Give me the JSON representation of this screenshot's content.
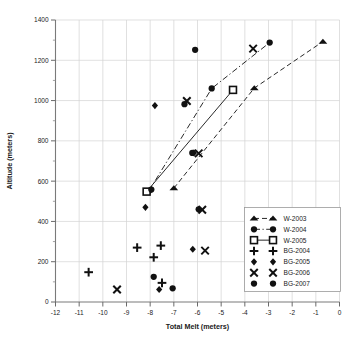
{
  "chart_data": {
    "type": "scatter",
    "title": "",
    "xlabel": "Total Melt  (meters)",
    "ylabel": "Altitude (meters)",
    "xlim": [
      -12,
      0
    ],
    "ylim": [
      0,
      1400
    ],
    "xticks": [
      -12,
      -11,
      -10,
      -9,
      -8,
      -7,
      -6,
      -5,
      -4,
      -3,
      -2,
      -1,
      0
    ],
    "xtick_labels": [
      "-12",
      "-11",
      "-10",
      "-9",
      "-8",
      "-7",
      "-6",
      "-5",
      "-4",
      "-3",
      "-2",
      "-1",
      "0"
    ],
    "yticks": [
      0,
      200,
      400,
      600,
      800,
      1000,
      1200,
      1400
    ],
    "ytick_labels": [
      "0",
      "200",
      "400",
      "600",
      "800",
      "1000",
      "1200",
      "1400"
    ],
    "y_minor_ticks": [
      100,
      300,
      500,
      700,
      900,
      1100,
      1300
    ],
    "grid": true,
    "grid_axis": "both",
    "legend_position": "lower-right",
    "series": [
      {
        "name": "W-2003",
        "marker": "triangle",
        "filled": true,
        "line": "dashed",
        "points": [
          {
            "x": -7.0,
            "y": 565
          },
          {
            "x": -3.6,
            "y": 1062
          },
          {
            "x": -0.7,
            "y": 1293
          }
        ]
      },
      {
        "name": "W-2004",
        "marker": "circle",
        "filled": true,
        "line": "dash-dot",
        "points": [
          {
            "x": -8.05,
            "y": 552
          },
          {
            "x": -5.4,
            "y": 1060
          },
          {
            "x": -2.95,
            "y": 1288
          }
        ]
      },
      {
        "name": "W-2005",
        "marker": "square-open",
        "filled": false,
        "line": "solid",
        "points": [
          {
            "x": -8.15,
            "y": 548
          },
          {
            "x": -4.5,
            "y": 1053
          }
        ]
      },
      {
        "name": "BG-2004",
        "marker": "plus",
        "filled": true,
        "line": "none",
        "points": [
          {
            "x": -10.6,
            "y": 148
          },
          {
            "x": -8.55,
            "y": 270
          },
          {
            "x": -7.85,
            "y": 222
          },
          {
            "x": -7.55,
            "y": 280
          },
          {
            "x": -7.5,
            "y": 95
          }
        ]
      },
      {
        "name": "BG-2005",
        "marker": "diamond",
        "filled": true,
        "line": "none",
        "points": [
          {
            "x": -7.8,
            "y": 975
          },
          {
            "x": -8.2,
            "y": 470
          },
          {
            "x": -6.15,
            "y": 740
          },
          {
            "x": -6.2,
            "y": 262
          },
          {
            "x": -7.62,
            "y": 62
          }
        ]
      },
      {
        "name": "BG-2006",
        "marker": "cross",
        "filled": true,
        "line": "none",
        "points": [
          {
            "x": -9.4,
            "y": 62
          },
          {
            "x": -6.45,
            "y": 998
          },
          {
            "x": -5.95,
            "y": 738
          },
          {
            "x": -5.8,
            "y": 458
          },
          {
            "x": -5.68,
            "y": 255
          },
          {
            "x": -3.65,
            "y": 1258
          }
        ]
      },
      {
        "name": "BG-2007",
        "marker": "circle",
        "filled": true,
        "line": "none",
        "points": [
          {
            "x": -6.1,
            "y": 1252
          },
          {
            "x": -6.55,
            "y": 982
          },
          {
            "x": -6.22,
            "y": 740
          },
          {
            "x": -5.95,
            "y": 460
          },
          {
            "x": -7.85,
            "y": 125
          },
          {
            "x": -7.05,
            "y": 68
          },
          {
            "x": -7.95,
            "y": 558
          }
        ]
      }
    ]
  },
  "legend": {
    "entries": [
      {
        "label": "W-2003"
      },
      {
        "label": "W-2004"
      },
      {
        "label": "W-2005"
      },
      {
        "label": "BG-2004"
      },
      {
        "label": "BG-2005"
      },
      {
        "label": "BG-2006"
      },
      {
        "label": "BG-2007"
      }
    ]
  },
  "colors": {
    "marker": "#111111",
    "grid": "#d2d2d2",
    "axis": "#7a7a7a",
    "text": "#1a1a1a",
    "background": "#ffffff"
  }
}
